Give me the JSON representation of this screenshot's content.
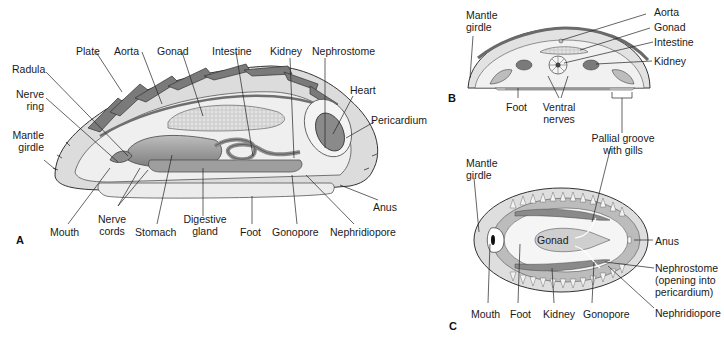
{
  "figure": {
    "panels": [
      {
        "id": "A",
        "view": "longitudinal section",
        "labels": {
          "plate": "Plate",
          "aorta": "Aorta",
          "gonad": "Gonad",
          "intestine": "Intestine",
          "kidney": "Kidney",
          "nephrostome": "Nephrostome",
          "radula": "Radula",
          "nerve_ring_1": "Nerve",
          "nerve_ring_2": "ring",
          "mantle_girdle_1": "Mantle",
          "mantle_girdle_2": "girdle",
          "heart": "Heart",
          "pericardium": "Pericardium",
          "anus": "Anus",
          "mouth": "Mouth",
          "nerve_cords_1": "Nerve",
          "nerve_cords_2": "cords",
          "stomach": "Stomach",
          "digestive_gland_1": "Digestive",
          "digestive_gland_2": "gland",
          "foot": "Foot",
          "gonopore": "Gonopore",
          "nephridiopore": "Nephridiopore"
        }
      },
      {
        "id": "B",
        "view": "cross section",
        "labels": {
          "mantle_girdle_1": "Mantle",
          "mantle_girdle_2": "girdle",
          "aorta": "Aorta",
          "gonad": "Gonad",
          "intestine": "Intestine",
          "kidney": "Kidney",
          "foot": "Foot",
          "ventral_nerves_1": "Ventral",
          "ventral_nerves_2": "nerves",
          "pallial_groove_1": "Pallial groove",
          "pallial_groove_2": "with gills"
        }
      },
      {
        "id": "C",
        "view": "ventral view",
        "labels": {
          "mantle_girdle_1": "Mantle",
          "mantle_girdle_2": "girdle",
          "gonad": "Gonad",
          "anus": "Anus",
          "nephrostome_1": "Nephrostome",
          "nephrostome_2": "(opening into",
          "nephrostome_3": "pericardium)",
          "nephridiopore": "Nephridiopore",
          "mouth": "Mouth",
          "foot": "Foot",
          "kidney": "Kidney",
          "gonopore": "Gonopore"
        }
      }
    ]
  },
  "colors": {
    "outline": "#333333",
    "shell_light": "#d9d9d9",
    "shell_mid": "#a8a8a8",
    "plate_dark": "#6e6e6e",
    "organ": "#9a9a9a",
    "organ_dark": "#707070",
    "body_fill": "#ededed",
    "leader": "#222222"
  }
}
